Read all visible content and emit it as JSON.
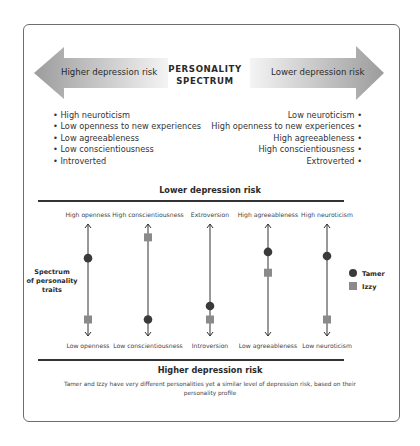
{
  "header": {
    "left_arrow_label": "Higher depression risk",
    "right_arrow_label": "Lower depression risk",
    "title_line1": "PERSONALITY",
    "title_line2": "SPECTRUM"
  },
  "higher_risk_traits": [
    "High neuroticism",
    "Low openness to new experiences",
    "Low agreeableness",
    "Low conscientiousness",
    "Introverted"
  ],
  "lower_risk_traits": [
    "Low neuroticism",
    "High openness to new experiences",
    "High agreeableness",
    "High conscientiousness",
    "Extroverted"
  ],
  "bullet": "•",
  "colors": {
    "tamer": "#3a3a3a",
    "izzy": "#8a8a8a",
    "axis": "#333333",
    "arrow_light": "#efefef",
    "arrow_dark": "#9a9a9a"
  },
  "chart_data": {
    "type": "scatter",
    "title_top": "Lower depression risk",
    "title_bottom": "Higher depression risk",
    "side_label": [
      "Spectrum",
      "of personality",
      "traits"
    ],
    "scale": "0 = bottom (higher risk pole), 1 = top (lower risk pole)",
    "ylim": [
      0,
      1
    ],
    "axes": [
      {
        "top": "High openness",
        "bottom": "Low openness"
      },
      {
        "top": "High conscientiousness",
        "bottom": "Low conscientiousness"
      },
      {
        "top": "Extroversion",
        "bottom": "Introversion"
      },
      {
        "top": "High agreeableness",
        "bottom": "Low agreeableness"
      },
      {
        "top": "High neuroticism",
        "bottom": "Low neuroticism"
      }
    ],
    "series": [
      {
        "name": "Tamer",
        "marker": "circle",
        "values": [
          0.71,
          0.12,
          0.25,
          0.77,
          0.73
        ]
      },
      {
        "name": "Izzy",
        "marker": "square",
        "values": [
          0.12,
          0.91,
          0.12,
          0.57,
          0.12
        ]
      }
    ],
    "legend": [
      "Tamer",
      "Izzy"
    ],
    "legend_position": "right",
    "caption": "Tamer and Izzy have very different personalities yet a similar level of depression risk, based on their personality profile"
  }
}
